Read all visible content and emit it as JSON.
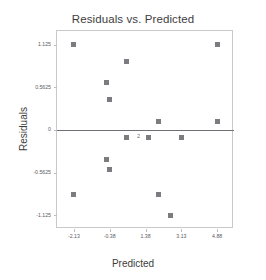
{
  "chart_data": {
    "type": "scatter",
    "title": "Residuals vs. Predicted",
    "xlabel": "Predicted",
    "ylabel": "Residuals",
    "xlim": [
      -2.955,
      5.705
    ],
    "ylim": [
      -1.305,
      1.305
    ],
    "grid": false,
    "legend": null,
    "xticks": [
      -2.13,
      -0.38,
      1.38,
      3.13,
      4.88
    ],
    "xticklabels": [
      "-2.13",
      "-0.38",
      "1.38",
      "3.13",
      "4.88"
    ],
    "yticks": [
      1.125,
      0.5625,
      0,
      -0.5625,
      -1.125
    ],
    "yticklabels": [
      "1.125",
      "0.5625",
      "0",
      "-0.5625",
      "-1.125"
    ],
    "reference_lines": [
      {
        "axis": "y",
        "value": 0,
        "color": "#6e6e74"
      }
    ],
    "marker": {
      "shape": "square",
      "color": "#7b7b80",
      "size": 5
    },
    "points": [
      {
        "x": -2.13,
        "y": 1.125,
        "count": 1
      },
      {
        "x": 4.88,
        "y": 1.125,
        "count": 1
      },
      {
        "x": 0.43,
        "y": 0.905,
        "count": 1
      },
      {
        "x": -0.55,
        "y": 0.625,
        "count": 1
      },
      {
        "x": -0.38,
        "y": 0.4,
        "count": 1
      },
      {
        "x": 2.0,
        "y": 0.115,
        "count": 1
      },
      {
        "x": 4.88,
        "y": 0.115,
        "count": 1
      },
      {
        "x": 0.43,
        "y": -0.1,
        "count": 1
      },
      {
        "x": 1.5,
        "y": -0.1,
        "count": 2,
        "label": "2"
      },
      {
        "x": 3.13,
        "y": -0.1,
        "count": 1
      },
      {
        "x": -0.55,
        "y": -0.39,
        "count": 1
      },
      {
        "x": -0.38,
        "y": -0.52,
        "count": 1
      },
      {
        "x": -2.13,
        "y": -0.85,
        "count": 1
      },
      {
        "x": 2.0,
        "y": -0.85,
        "count": 1
      },
      {
        "x": 2.6,
        "y": -1.125,
        "count": 1
      }
    ]
  }
}
